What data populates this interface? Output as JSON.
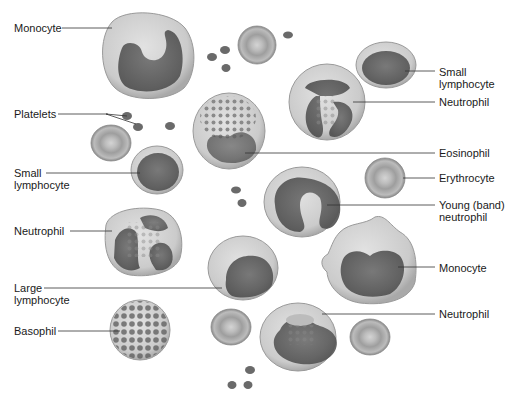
{
  "diagram": {
    "title": "",
    "type": "Blood cell types (labeled illustration)",
    "labels_left": [
      {
        "id": "monocyte-1",
        "lines": [
          "Monocyte"
        ],
        "x": 14,
        "y": 22
      },
      {
        "id": "platelets",
        "lines": [
          "Platelets"
        ],
        "x": 14,
        "y": 110
      },
      {
        "id": "small-lymphocyte-2",
        "lines": [
          "Small",
          "lymphocyte"
        ],
        "x": 14,
        "y": 168
      },
      {
        "id": "neutrophil-2",
        "lines": [
          "Neutrophil"
        ],
        "x": 14,
        "y": 226
      },
      {
        "id": "large-lymphocyte",
        "lines": [
          "Large",
          "lymphocyte"
        ],
        "x": 14,
        "y": 283
      },
      {
        "id": "basophil",
        "lines": [
          "Basophil"
        ],
        "x": 14,
        "y": 326
      }
    ],
    "labels_right": [
      {
        "id": "small-lymphocyte-1",
        "lines": [
          "Small",
          "lymphocyte"
        ],
        "x": 440,
        "y": 68
      },
      {
        "id": "neutrophil-1",
        "lines": [
          "Neutrophil"
        ],
        "x": 440,
        "y": 97
      },
      {
        "id": "eosinophil",
        "lines": [
          "Eosinophil"
        ],
        "x": 440,
        "y": 148
      },
      {
        "id": "erythrocyte",
        "lines": [
          "Erythrocyte"
        ],
        "x": 440,
        "y": 173
      },
      {
        "id": "young-band-neutrophil",
        "lines": [
          "Young (band)",
          "neutrophil"
        ],
        "x": 440,
        "y": 200
      },
      {
        "id": "monocyte-2",
        "lines": [
          "Monocyte"
        ],
        "x": 440,
        "y": 263
      },
      {
        "id": "neutrophil-3",
        "lines": [
          "Neutrophil"
        ],
        "x": 440,
        "y": 309
      }
    ],
    "colors": {
      "cytoplasm": "#cfcfcf",
      "nucleus": "#5e5e5e",
      "erythrocyte": "#b0b0b0",
      "leader_line": "#333333",
      "text": "#1a1a1a"
    }
  }
}
